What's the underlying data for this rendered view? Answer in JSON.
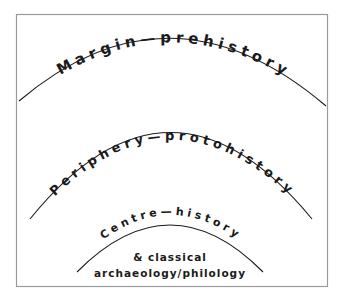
{
  "diagram": {
    "title": "",
    "zones": [
      {
        "id": "outer",
        "label": "Margin—prehistory"
      },
      {
        "id": "middle",
        "label": "Periphery—protohistory"
      },
      {
        "id": "inner",
        "label": "Centre—history"
      }
    ],
    "centre_note": {
      "line1": "& classical",
      "line2": "archaeology/philology"
    },
    "colors": {
      "ink": "#1a1a1a",
      "frame": "#9a9a9a",
      "background": "#ffffff"
    }
  }
}
